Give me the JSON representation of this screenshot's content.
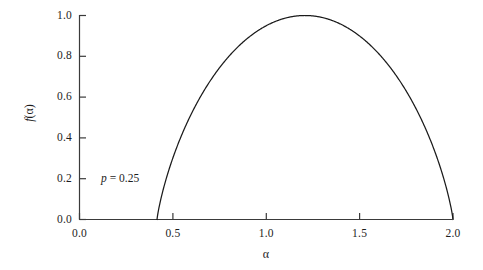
{
  "figure": {
    "background_color": "#ffffff",
    "line_color": "#1a1a1a",
    "axis_color": "#3a3a3a"
  },
  "axes": {
    "x_title": "α",
    "y_title_function": "f",
    "y_title_arg_open": "(",
    "y_title_arg": "α",
    "y_title_arg_close": ")",
    "x_tick_labels": [
      "0.0",
      "0.5",
      "1.0",
      "1.5",
      "2.0"
    ],
    "y_tick_labels": [
      "0.0",
      "0.2",
      "0.4",
      "0.6",
      "0.8",
      "1.0"
    ]
  },
  "annotation": {
    "param_symbol": "p",
    "param_equals": " = ",
    "param_value": "0.25",
    "full_text": "p = 0.25"
  },
  "chart_data": {
    "type": "line",
    "title": "",
    "subtitle": "",
    "xlabel": "α",
    "ylabel": "f(α)",
    "xlim": [
      0.0,
      2.0
    ],
    "ylim": [
      0.0,
      1.0
    ],
    "xticks": [
      0.0,
      0.5,
      1.0,
      1.5,
      2.0
    ],
    "yticks": [
      0.0,
      0.2,
      0.4,
      0.6,
      0.8,
      1.0
    ],
    "grid": false,
    "legend": null,
    "annotations": [
      {
        "text": "p = 0.25",
        "x": 0.115,
        "y": 0.205
      }
    ],
    "series": [
      {
        "name": "f(α) multifractal spectrum, p = 0.25",
        "parameter_p": 0.25,
        "alpha_min": 0.415,
        "alpha_max": 2.0,
        "alpha_at_peak": 1.2,
        "peak_value": 1.0,
        "x": [
          0.415,
          0.45,
          0.5,
          0.55,
          0.6,
          0.65,
          0.7,
          0.75,
          0.8,
          0.85,
          0.9,
          0.95,
          1.0,
          1.05,
          1.1,
          1.15,
          1.2,
          1.2075,
          1.25,
          1.3,
          1.35,
          1.4,
          1.45,
          1.5,
          1.55,
          1.6,
          1.65,
          1.7,
          1.75,
          1.8,
          1.85,
          1.9,
          1.95,
          2.0
        ],
        "y": [
          0.0,
          0.173,
          0.306,
          0.407,
          0.491,
          0.563,
          0.627,
          0.683,
          0.733,
          0.779,
          0.82,
          0.857,
          0.89,
          0.919,
          0.944,
          0.965,
          0.982,
          0.9995,
          0.995,
          0.998,
          0.993,
          0.981,
          0.962,
          0.936,
          0.903,
          0.863,
          0.815,
          0.76,
          0.696,
          0.623,
          0.539,
          0.441,
          0.323,
          0.0
        ]
      }
    ]
  }
}
